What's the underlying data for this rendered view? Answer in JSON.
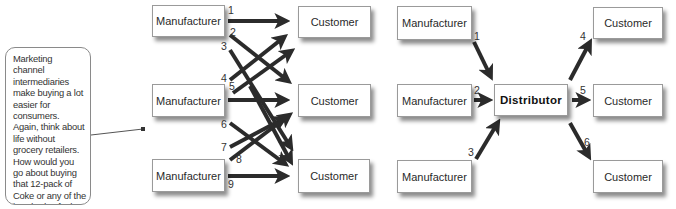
{
  "callout": {
    "text": "Marketing channel intermediaries make buying a lot easier for consumers. Again, think about life without grocery retailers. How would you go about buying that 12-pack of Coke or any of the hundreds of other items that you now routinely drop into your shopping cart?"
  },
  "left_diagram": {
    "manufacturers": [
      {
        "label": "Manufacturer"
      },
      {
        "label": "Manufacturer"
      },
      {
        "label": "Manufacturer"
      }
    ],
    "customers": [
      {
        "label": "Customer"
      },
      {
        "label": "Customer"
      },
      {
        "label": "Customer"
      }
    ],
    "link_numbers": [
      "1",
      "2",
      "3",
      "4",
      "5",
      "6",
      "7",
      "8",
      "9"
    ]
  },
  "right_diagram": {
    "manufacturers": [
      {
        "label": "Manufacturer"
      },
      {
        "label": "Manufacturer"
      },
      {
        "label": "Manufacturer"
      }
    ],
    "distributor": {
      "label": "Distributor"
    },
    "customers": [
      {
        "label": "Customer"
      },
      {
        "label": "Customer"
      },
      {
        "label": "Customer"
      }
    ],
    "link_numbers": [
      "1",
      "2",
      "3",
      "4",
      "5",
      "6"
    ]
  },
  "colors": {
    "arrow": "#2b2b2b",
    "box_border": "#9a9a9a",
    "text": "#2a2a2a"
  }
}
